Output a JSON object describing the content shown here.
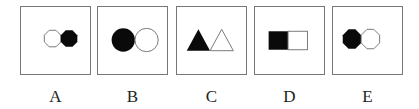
{
  "options": [
    {
      "label": "A",
      "description": "white octagon left, black octagon right"
    },
    {
      "label": "B",
      "description": "black circle left, white circle right"
    },
    {
      "label": "C",
      "description": "black triangle left, white triangle right"
    },
    {
      "label": "D",
      "description": "black square left, white square right"
    },
    {
      "label": "E",
      "description": "black octagon left, white octagon right"
    }
  ],
  "colors": {
    "fill_dark": "#0a0a0a",
    "fill_light": "#ffffff",
    "stroke": "#777777"
  }
}
